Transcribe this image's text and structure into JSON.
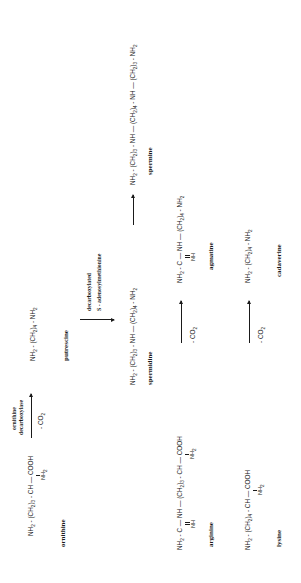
{
  "diagram": {
    "orientation": "rotated 90 degrees counter-clockwise",
    "compounds": {
      "ornithine": {
        "name": "ornithine",
        "formula_main": "NH2 - (CH2)3 - CH — COOH",
        "parts": [
          "NH",
          "2",
          " - (CH",
          "2",
          ")",
          "3",
          " - CH — COOH"
        ],
        "substituent": "NH2"
      },
      "putrescine": {
        "name": "putrescine",
        "formula_main": "NH2 - (CH2)4 - NH2",
        "parts": [
          "NH",
          "2",
          " - (CH",
          "2",
          ")",
          "4",
          " - NH",
          "2"
        ]
      },
      "spermidine": {
        "name": "spermidine",
        "formula_main": "NH2 - (CH2)3 - NH — (CH2)4 - NH2",
        "parts": [
          "NH",
          "2",
          " - (CH",
          "2",
          ")",
          "3",
          " - NH — (CH",
          "2",
          ")",
          "4",
          " - NH",
          "2"
        ]
      },
      "spermine": {
        "name": "spermine",
        "formula_main": "NH2 - (CH2)3 - NH — (CH2)4 - NH — (CH2)3 - NH2",
        "parts": [
          "NH",
          "2",
          " - (CH",
          "2",
          ")",
          "3",
          " - NH — (CH",
          "2",
          ")",
          "4",
          " - NH — (CH",
          "2",
          ")",
          "3",
          " - NH",
          "2"
        ]
      },
      "arginine": {
        "name": "arginine",
        "formula_main": "NH2 - C — NH — (CH2)3 - CH — COOH",
        "parts": [
          "NH",
          "2",
          " - C — NH — (CH",
          "2",
          ")",
          "3",
          " - CH — COOH"
        ],
        "substituent_c": "NH",
        "substituent_ch": "NH2"
      },
      "agmatine": {
        "name": "agmatine",
        "formula_main": "NH2 - C — NH — (CH2)4 - NH2",
        "parts": [
          "NH",
          "2",
          " - C — NH — (CH",
          "2",
          ")",
          "4",
          " - NH",
          "2"
        ],
        "substituent_c": "NH"
      },
      "lysine": {
        "name": "lysine",
        "formula_main": "NH2 - (CH2)4 - CH — COOH",
        "parts": [
          "NH",
          "2",
          " - (CH",
          "2",
          ")",
          "4",
          " - CH — COOH"
        ],
        "substituent": "NH2"
      },
      "cadaverine": {
        "name": "cadaverine",
        "formula_main": "NH2 - (CH2)4 - NH2",
        "parts": [
          "NH",
          "2",
          " - (CH",
          "2",
          ")",
          "4",
          " - NH",
          "2"
        ]
      }
    },
    "arrows": [
      {
        "from": "ornithine",
        "to": "putrescine",
        "label_above": [
          "ornithine",
          "decarboxylase"
        ],
        "label_below": "- CO2"
      },
      {
        "from": "putrescine",
        "to": "spermidine",
        "label_side": [
          "decarboxylated",
          "S - adenosylmethionine"
        ]
      },
      {
        "from": "spermidine",
        "to": "spermine"
      },
      {
        "from": "arginine",
        "to": "agmatine",
        "label_below": "- CO2"
      },
      {
        "from": "lysine",
        "to": "cadaverine",
        "label_below": "- CO2"
      }
    ],
    "labels": {
      "enzyme_line1": "ornithine",
      "enzyme_line2": "decarboxylase",
      "co2": "- CO",
      "co2_sub": "2",
      "samd_line1": "decarboxylated",
      "samd_line2": "S - adenosylmethionine"
    }
  }
}
